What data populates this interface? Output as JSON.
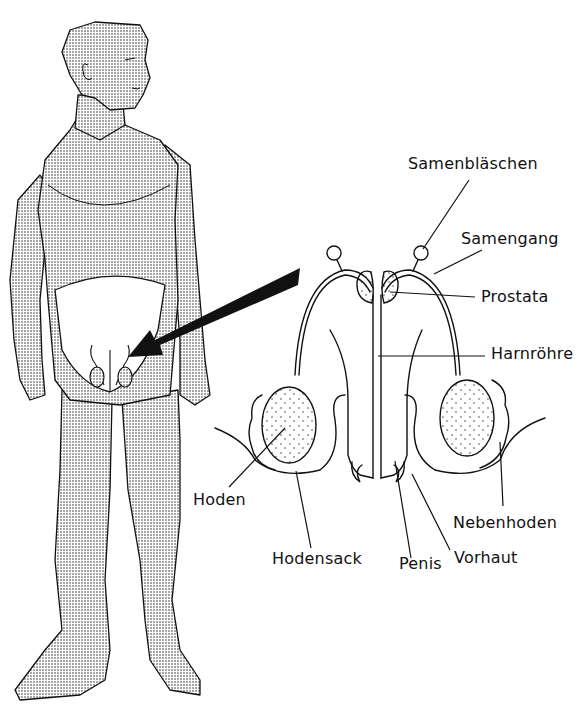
{
  "diagram": {
    "type": "anatomical-illustration",
    "colors": {
      "ink": "#111111",
      "background": "#ffffff",
      "stipple": "#222222"
    },
    "figure": {
      "description": "standing male figure with stippled skin, arrow pointing to pelvic region"
    },
    "labels": {
      "samenblaeschen": "Samenbläschen",
      "samengang": "Samengang",
      "prostata": "Prostata",
      "harnroehre": "Harnröhre",
      "hoden": "Hoden",
      "nebenhoden": "Nebenhoden",
      "hodensack": "Hodensack",
      "penis": "Penis",
      "vorhaut": "Vorhaut"
    }
  }
}
